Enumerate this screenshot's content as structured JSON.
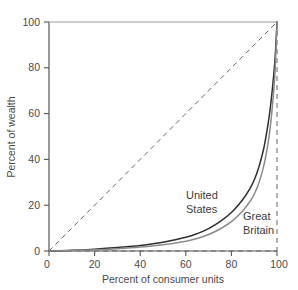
{
  "chart_data": {
    "type": "line",
    "title": "",
    "subtitle": "",
    "xlabel": "Percent of consumer units",
    "ylabel": "Percent of wealth",
    "xlim": [
      0,
      100
    ],
    "ylim": [
      0,
      100
    ],
    "xticks": [
      0,
      20,
      40,
      60,
      80,
      100
    ],
    "yticks": [
      0,
      20,
      40,
      60,
      80,
      100
    ],
    "xticklabels": [
      "0",
      "20",
      "40",
      "60",
      "80",
      "100"
    ],
    "yticklabels": [
      "0",
      "20",
      "40",
      "60",
      "80",
      "100"
    ],
    "grid": false,
    "legend_position": "inline-annotation",
    "annotations": [
      {
        "name": "united-states",
        "text_line1": "United",
        "text_line2": "States",
        "x": 63,
        "y": 17
      },
      {
        "name": "great-britain",
        "text_line1": "Great",
        "text_line2": "Britain",
        "x": 88,
        "y": 9
      }
    ],
    "reference_line": {
      "name": "line-of-equality",
      "style": "dashed",
      "x": [
        0,
        100
      ],
      "y": [
        0,
        100
      ]
    },
    "series": [
      {
        "name": "United States",
        "color": "#2f2f2f",
        "style": "solid",
        "x": [
          0,
          10,
          20,
          30,
          40,
          50,
          60,
          65,
          70,
          75,
          80,
          85,
          88,
          90,
          92,
          94,
          95,
          96,
          97,
          98,
          99,
          99.5,
          100
        ],
        "y": [
          0,
          0.3,
          0.8,
          1.5,
          2.4,
          3.8,
          6.0,
          7.6,
          9.8,
          12.8,
          16.8,
          22.5,
          27.0,
          31.0,
          36.5,
          44.0,
          49.0,
          55.0,
          62.0,
          71.0,
          82.0,
          90.0,
          100
        ]
      },
      {
        "name": "Great Britain",
        "color": "#8a8a8a",
        "style": "solid",
        "x": [
          0,
          10,
          20,
          30,
          40,
          50,
          60,
          65,
          70,
          75,
          80,
          85,
          88,
          90,
          92,
          94,
          95,
          96,
          97,
          98,
          99,
          99.5,
          100
        ],
        "y": [
          0,
          0.2,
          0.5,
          1.0,
          1.7,
          2.7,
          4.3,
          5.5,
          7.2,
          9.6,
          12.8,
          17.6,
          21.4,
          24.8,
          29.6,
          36.4,
          41.0,
          46.6,
          53.8,
          63.5,
          76.0,
          86.0,
          100
        ]
      }
    ],
    "boundary_lines": {
      "left_axis": "solid",
      "bottom_axis": "solid",
      "top_edge": "solid-gray",
      "right_edge": "dashed",
      "bottom_dashed_overlay": "dashed"
    }
  }
}
